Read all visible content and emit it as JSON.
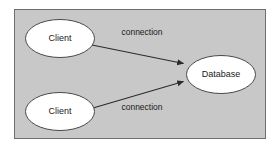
{
  "diagram": {
    "type": "component-connection-diagram",
    "panel": {
      "fill": "#c8c8c8",
      "border_color": "#6e6e6e",
      "x": 14,
      "y": 9,
      "width": 252,
      "height": 130
    },
    "page_background": "#ffffff",
    "nodes": [
      {
        "id": "client-top",
        "label": "Client",
        "shape": "ellipse",
        "fill": "#ffffff",
        "stroke": "#4a4a4a",
        "cx": 60,
        "cy": 38.5,
        "rx": 35,
        "ry": 19.5
      },
      {
        "id": "client-bottom",
        "label": "Client",
        "shape": "ellipse",
        "fill": "#ffffff",
        "stroke": "#4a4a4a",
        "cx": 60,
        "cy": 111.5,
        "rx": 35,
        "ry": 19.5
      },
      {
        "id": "database",
        "label": "Database",
        "shape": "ellipse",
        "fill": "#ffffff",
        "stroke": "#4a4a4a",
        "cx": 221,
        "cy": 74.5,
        "rx": 35,
        "ry": 19.5
      }
    ],
    "edges": [
      {
        "id": "edge-top",
        "label": "connection",
        "from": "client-top",
        "to": "database",
        "stroke": "#2b2b2b",
        "arrowhead": "solid-triangle",
        "x1": 92,
        "y1": 45,
        "x2": 186,
        "y2": 64,
        "label_x": 142,
        "label_y": 33
      },
      {
        "id": "edge-bottom",
        "label": "connection",
        "from": "client-bottom",
        "to": "database",
        "stroke": "#2b2b2b",
        "arrowhead": "solid-triangle",
        "x1": 93,
        "y1": 108,
        "x2": 186,
        "y2": 81,
        "label_x": 142,
        "label_y": 108
      }
    ]
  }
}
